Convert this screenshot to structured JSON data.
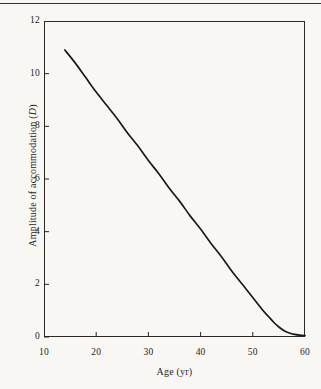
{
  "figure": {
    "background_color": "#f8f7f3",
    "ink_color": "#25231f",
    "rule_color": "#33312c",
    "curve_color": "#1a1a1a"
  },
  "chart_data": {
    "type": "line",
    "title": "",
    "subtitle": "",
    "xlabel_prefix": "Age",
    "xlabel_unit": "(yr)",
    "xlabel": "Age (yr)",
    "ylabel_prefix": "Amplitude of accommodation",
    "ylabel_symbol": "D",
    "ylabel": "Amplitude of accommodation (D)",
    "xlim": [
      10,
      60
    ],
    "ylim": [
      0,
      12
    ],
    "xticks": [
      10,
      20,
      30,
      40,
      50,
      60
    ],
    "yticks": [
      0,
      2,
      4,
      6,
      8,
      10,
      12
    ],
    "xtick_labels": [
      "10",
      "20",
      "30",
      "40",
      "50",
      "60"
    ],
    "ytick_labels": [
      "0",
      "2",
      "4",
      "6",
      "8",
      "10",
      "12"
    ],
    "grid": false,
    "legend": false,
    "legend_position": "none",
    "tick_direction": "in",
    "annotations": [],
    "series": [
      {
        "name": "Amplitude of accommodation",
        "x": [
          14,
          16,
          18,
          20,
          22,
          24,
          26,
          28,
          30,
          32,
          34,
          36,
          38,
          40,
          42,
          44,
          46,
          48,
          50,
          52,
          53,
          54,
          55,
          56,
          57,
          58,
          59,
          60
        ],
        "y": [
          10.9,
          10.4,
          9.85,
          9.3,
          8.8,
          8.3,
          7.75,
          7.25,
          6.7,
          6.2,
          5.65,
          5.15,
          4.6,
          4.1,
          3.55,
          3.05,
          2.5,
          2.0,
          1.5,
          1.0,
          0.78,
          0.56,
          0.38,
          0.24,
          0.15,
          0.1,
          0.07,
          0.05
        ]
      }
    ]
  }
}
